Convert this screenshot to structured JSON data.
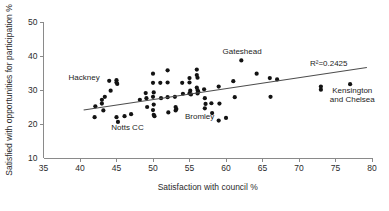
{
  "chart_data": {
    "type": "scatter",
    "title": "",
    "xlabel": "Satisfaction with council %",
    "ylabel": "Satisfied with opportunities for participation %",
    "xlim": [
      35,
      80
    ],
    "ylim": [
      10,
      50
    ],
    "xticks": [
      35,
      40,
      45,
      50,
      55,
      60,
      65,
      70,
      75,
      80
    ],
    "yticks": [
      10,
      20,
      30,
      40,
      50
    ],
    "grid": false,
    "legend": false,
    "marker": "filled-circle",
    "marker_color": "#131313",
    "trendline": {
      "type": "linear",
      "x_start": 40.5,
      "y_start": 24.1,
      "x_end": 79.3,
      "y_end": 36.6,
      "color": "#4d4d4d",
      "r_squared_label": "R²=0.2425"
    },
    "points": [
      {
        "x": 42.0,
        "y": 22.0
      },
      {
        "x": 42.1,
        "y": 25.2
      },
      {
        "x": 43.0,
        "y": 27.1
      },
      {
        "x": 43.0,
        "y": 26.0
      },
      {
        "x": 43.2,
        "y": 24.0
      },
      {
        "x": 43.4,
        "y": 28.0
      },
      {
        "x": 44.0,
        "y": 32.7
      },
      {
        "x": 44.2,
        "y": 29.8
      },
      {
        "x": 45.0,
        "y": 32.9
      },
      {
        "x": 45.0,
        "y": 32.2
      },
      {
        "x": 45.1,
        "y": 31.8
      },
      {
        "x": 45.0,
        "y": 22.0
      },
      {
        "x": 45.2,
        "y": 20.6
      },
      {
        "x": 46.1,
        "y": 22.3
      },
      {
        "x": 47.0,
        "y": 22.9
      },
      {
        "x": 48.2,
        "y": 27.1
      },
      {
        "x": 49.0,
        "y": 29.1
      },
      {
        "x": 49.1,
        "y": 27.6
      },
      {
        "x": 49.2,
        "y": 25.0
      },
      {
        "x": 50.0,
        "y": 34.8
      },
      {
        "x": 50.0,
        "y": 32.1
      },
      {
        "x": 50.1,
        "y": 29.3
      },
      {
        "x": 50.0,
        "y": 28.0
      },
      {
        "x": 50.1,
        "y": 25.7
      },
      {
        "x": 50.0,
        "y": 24.1
      },
      {
        "x": 50.1,
        "y": 22.7
      },
      {
        "x": 50.2,
        "y": 22.3
      },
      {
        "x": 51.0,
        "y": 32.1
      },
      {
        "x": 51.1,
        "y": 27.6
      },
      {
        "x": 52.0,
        "y": 35.8
      },
      {
        "x": 52.0,
        "y": 32.2
      },
      {
        "x": 52.0,
        "y": 27.9
      },
      {
        "x": 52.1,
        "y": 23.4
      },
      {
        "x": 53.0,
        "y": 28.0
      },
      {
        "x": 53.1,
        "y": 25.0
      },
      {
        "x": 53.2,
        "y": 24.4
      },
      {
        "x": 53.1,
        "y": 24.0
      },
      {
        "x": 54.0,
        "y": 32.1
      },
      {
        "x": 54.1,
        "y": 28.9
      },
      {
        "x": 55.0,
        "y": 33.5
      },
      {
        "x": 55.0,
        "y": 32.2
      },
      {
        "x": 55.1,
        "y": 29.8
      },
      {
        "x": 55.0,
        "y": 29.0
      },
      {
        "x": 55.2,
        "y": 28.7
      },
      {
        "x": 56.0,
        "y": 36.0
      },
      {
        "x": 56.0,
        "y": 34.4
      },
      {
        "x": 56.1,
        "y": 33.6
      },
      {
        "x": 56.0,
        "y": 30.7
      },
      {
        "x": 56.1,
        "y": 30.0
      },
      {
        "x": 56.2,
        "y": 29.5
      },
      {
        "x": 56.1,
        "y": 29.0
      },
      {
        "x": 57.0,
        "y": 30.2
      },
      {
        "x": 57.1,
        "y": 27.6
      },
      {
        "x": 57.2,
        "y": 25.9
      },
      {
        "x": 57.1,
        "y": 24.6
      },
      {
        "x": 58.0,
        "y": 26.1
      },
      {
        "x": 58.1,
        "y": 23.2
      },
      {
        "x": 59.0,
        "y": 31.0
      },
      {
        "x": 59.1,
        "y": 26.0
      },
      {
        "x": 59.0,
        "y": 21.0
      },
      {
        "x": 60.0,
        "y": 21.8
      },
      {
        "x": 61.0,
        "y": 32.6
      },
      {
        "x": 61.2,
        "y": 27.9
      },
      {
        "x": 62.1,
        "y": 38.7
      },
      {
        "x": 64.2,
        "y": 34.8
      },
      {
        "x": 66.0,
        "y": 33.5
      },
      {
        "x": 66.1,
        "y": 28.0
      },
      {
        "x": 67.0,
        "y": 33.1
      },
      {
        "x": 73.0,
        "y": 31.0
      },
      {
        "x": 73.0,
        "y": 30.1
      },
      {
        "x": 77.0,
        "y": 31.7
      }
    ],
    "annotations": [
      {
        "name": "hackney",
        "text": "Hackney",
        "x": 42.7,
        "y": 32.9,
        "anchor": "end",
        "lines": [
          "Hackney"
        ]
      },
      {
        "name": "notts-cc",
        "text": "Notts CC",
        "x": 46.5,
        "y": 18.2,
        "anchor": "middle",
        "lines": [
          "Notts CC"
        ]
      },
      {
        "name": "bromley",
        "text": "Bromley",
        "x": 58.4,
        "y": 21.6,
        "anchor": "end",
        "lines": [
          "Bromley"
        ]
      },
      {
        "name": "gateshead",
        "text": "Gateshead",
        "x": 62.2,
        "y": 40.6,
        "anchor": "middle",
        "lines": [
          "Gateshead"
        ]
      },
      {
        "name": "kensington-and-chelsea",
        "text": "Kensington and Chelsea",
        "x": 77.3,
        "y": 29.2,
        "anchor": "middle",
        "lines": [
          "Kensington",
          "and Chelsea"
        ]
      }
    ]
  }
}
